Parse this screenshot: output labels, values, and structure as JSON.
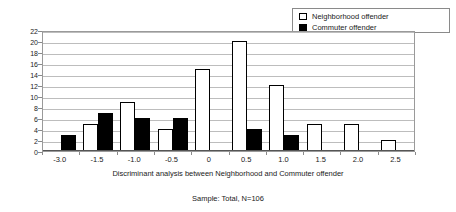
{
  "legend": {
    "position": "top-right",
    "entries": [
      {
        "label": "Neighborhood offender",
        "swatch": "white-square-outline-icon",
        "color": "#ffffff"
      },
      {
        "label": "Commuter offender",
        "swatch": "black-square-icon",
        "color": "#000000"
      }
    ]
  },
  "xaxis_title": "Discriminant analysis between Neighborhood and Commuter offender",
  "sample_note": "Sample: Total, N=106",
  "chart_data": {
    "type": "bar",
    "title": "",
    "subtitle": "",
    "xlabel": "Discriminant analysis between Neighborhood and Commuter offender",
    "ylabel": "",
    "annotations": [
      "Sample: Total, N=106"
    ],
    "categories": [
      "-3.0",
      "-1.5",
      "-1.0",
      "-0.5",
      "0",
      "0.5",
      "1.0",
      "1.5",
      "2.0",
      "2.5"
    ],
    "series": [
      {
        "name": "Neighborhood offender",
        "color": "#ffffff",
        "edgecolor": "#000000",
        "values": [
          0,
          5,
          9,
          4,
          15,
          20,
          12,
          5,
          5,
          2
        ]
      },
      {
        "name": "Commuter offender",
        "color": "#000000",
        "edgecolor": "#000000",
        "values": [
          3,
          7,
          6,
          6,
          0,
          4,
          3,
          0,
          0,
          0
        ]
      }
    ],
    "ylim": [
      0,
      22
    ],
    "ytick_values": [
      0,
      2,
      4,
      6,
      8,
      10,
      12,
      14,
      16,
      18,
      20,
      22
    ],
    "ytick_labels": [
      "0",
      "2",
      "4",
      "6",
      "8",
      "10",
      "12",
      "14",
      "16",
      "18",
      "20",
      "22"
    ],
    "grid": true,
    "grid_axis": "y",
    "legend_position": "upper right",
    "bar_mode": "grouped"
  }
}
